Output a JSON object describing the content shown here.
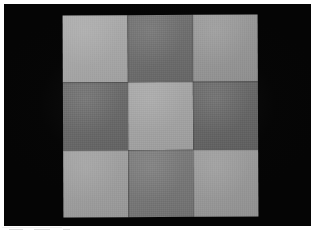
{
  "image": {
    "title": "Checkerboard gray swatch chart photograph",
    "width": 319,
    "height": 233,
    "border_color": "#ffffff",
    "backdrop_color": "#050505"
  },
  "chart_data": {
    "type": "heatmap",
    "rows": 3,
    "cols": 3,
    "xlabel": "",
    "ylabel": "",
    "grid": false,
    "legend": "none",
    "categories": [
      "col-1",
      "col-2",
      "col-3"
    ],
    "row_labels": [
      "row-1",
      "row-2",
      "row-3"
    ],
    "values": [
      [
        168,
        108,
        150
      ],
      [
        104,
        164,
        100
      ],
      [
        158,
        118,
        152
      ]
    ],
    "colors": [
      [
        "#a8a8a8",
        "#6c6c6c",
        "#969696"
      ],
      [
        "#686868",
        "#a4a4a4",
        "#646464"
      ],
      [
        "#9e9e9e",
        "#767676",
        "#989898"
      ]
    ]
  },
  "swatches": [
    {
      "name": "swatch-r1c1",
      "tone": "light",
      "color": "#a8a8a8",
      "value": 168
    },
    {
      "name": "swatch-r1c2",
      "tone": "dark",
      "color": "#6c6c6c",
      "value": 108
    },
    {
      "name": "swatch-r1c3",
      "tone": "light",
      "color": "#969696",
      "value": 150
    },
    {
      "name": "swatch-r2c1",
      "tone": "dark",
      "color": "#686868",
      "value": 104
    },
    {
      "name": "swatch-r2c2",
      "tone": "light",
      "color": "#a4a4a4",
      "value": 164
    },
    {
      "name": "swatch-r2c3",
      "tone": "dark",
      "color": "#646464",
      "value": 100
    },
    {
      "name": "swatch-r3c1",
      "tone": "light",
      "color": "#9e9e9e",
      "value": 158
    },
    {
      "name": "swatch-r3c2",
      "tone": "dark",
      "color": "#767676",
      "value": 118
    },
    {
      "name": "swatch-r3c3",
      "tone": "light",
      "color": "#989898",
      "value": 152
    }
  ]
}
